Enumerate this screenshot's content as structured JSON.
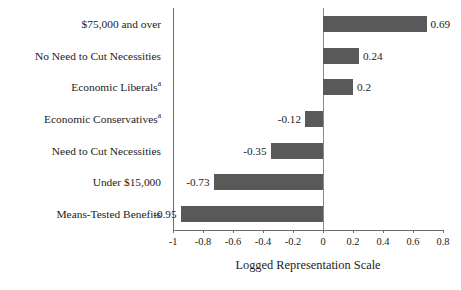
{
  "chart_data": {
    "type": "bar",
    "orientation": "horizontal",
    "title": "",
    "xlabel": "Logged Representation Scale",
    "ylabel": "",
    "xlim": [
      -1,
      0.8
    ],
    "xticks": [
      "-1",
      "-0.8",
      "-0.6",
      "-0.4",
      "-0.2",
      "0",
      "0.2",
      "0.4",
      "0.6",
      "0.8"
    ],
    "xtick_values": [
      -1,
      -0.8,
      -0.6,
      -0.4,
      -0.2,
      0,
      0.2,
      0.4,
      0.6,
      0.8
    ],
    "grid": false,
    "legend": "none",
    "zero_reference_line": true,
    "bar_color": "#595959",
    "axis_color": "#6e6e6e",
    "categories": [
      "$75,000 and over",
      "No Need to Cut Necessities",
      "Economic Liberals",
      "Economic Conservatives",
      "Need to Cut Necessities",
      "Under $15,000",
      "Means-Tested Benefits"
    ],
    "category_footnotes": [
      "",
      "",
      "a",
      "a",
      "",
      "",
      ""
    ],
    "values": [
      0.69,
      0.24,
      0.2,
      -0.12,
      -0.35,
      -0.73,
      -0.95
    ],
    "value_labels": [
      "0.69",
      "0.24",
      "0.2",
      "-0.12",
      "-0.35",
      "-0.73",
      "-0.95"
    ]
  }
}
